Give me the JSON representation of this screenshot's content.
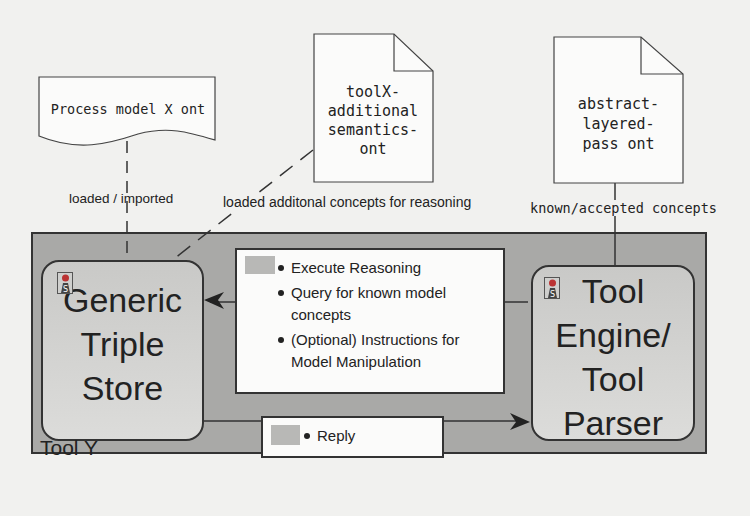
{
  "documents": {
    "process_model": {
      "text": "Process model X ont"
    },
    "toolx_semantics": {
      "lines": [
        "toolX-",
        "additional",
        "semantics-",
        "ont"
      ]
    },
    "abstract_layered": {
      "lines": [
        "abstract-",
        "layered-",
        "pass ont"
      ]
    }
  },
  "connectors": {
    "loaded_imported": "loaded / imported",
    "loaded_additional": "loaded additonal concepts for reasoning",
    "known_accepted": "known/accepted concepts"
  },
  "container": {
    "label": "Tool Y"
  },
  "nodes": {
    "triple_store": {
      "lines": [
        "Generic",
        "Triple",
        "Store"
      ]
    },
    "tool_engine": {
      "lines": [
        "Tool",
        "Engine/",
        "Tool",
        "Parser"
      ]
    }
  },
  "messages": {
    "request": {
      "items": [
        "Execute Reasoning",
        "Query for known model concepts",
        "(Optional) Instructions for Model Manipulation"
      ]
    },
    "reply": {
      "items": [
        "Reply"
      ]
    }
  },
  "icons": {
    "stereotype": "stereotype-s-icon",
    "message": "message-envelope-icon"
  },
  "colors": {
    "background": "#f1f1ef",
    "container_fill": "#a9a9a7",
    "node_fill": "#d2d2d0",
    "line": "#333333"
  }
}
